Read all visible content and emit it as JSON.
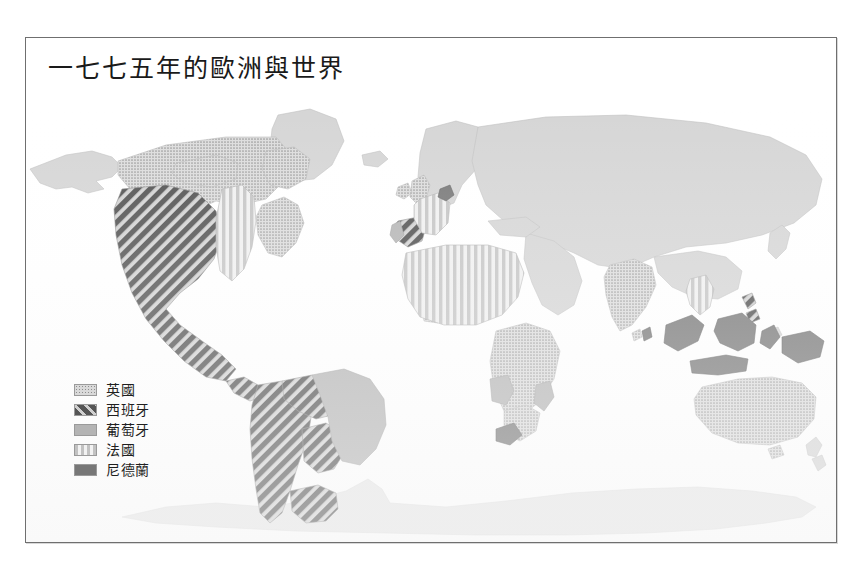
{
  "figure": {
    "title": "一七七五年的歐洲與世界",
    "frame_color": "#6f6f6f",
    "background_color": "#ffffff",
    "ocean_color": "#ffffff",
    "unclaimed_land_color": "#d5d5d5"
  },
  "legend": {
    "items": [
      {
        "label": "英國",
        "pattern": "dots",
        "swatch_class": "sw-dots",
        "color": "#d9d9d9"
      },
      {
        "label": "西班牙",
        "pattern": "diagonal",
        "swatch_class": "sw-diag",
        "color": "#555555"
      },
      {
        "label": "葡萄牙",
        "pattern": "solid-mid",
        "swatch_class": "sw-solidmid",
        "color": "#b4b4b4"
      },
      {
        "label": "法國",
        "pattern": "vertical",
        "swatch_class": "sw-vert",
        "color": "#c2c2c2"
      },
      {
        "label": "尼德蘭",
        "pattern": "solid-dark",
        "swatch_class": "sw-soliddark",
        "color": "#777777"
      }
    ]
  },
  "map_regions": {
    "britain": [
      "British Isles",
      "Canada",
      "Thirteen Colonies",
      "India",
      "Australia",
      "West Africa coast",
      "East Africa"
    ],
    "spain": [
      "Iberia",
      "Mexico",
      "Western North America",
      "Central America",
      "Spanish South America",
      "Philippines"
    ],
    "portugal": [
      "Portugal",
      "Brazil",
      "Angola",
      "Mozambique"
    ],
    "france": [
      "France",
      "North Africa",
      "Louisiana",
      "Indochina"
    ],
    "netherlands": [
      "Netherlands",
      "Dutch East Indies",
      "Ceylon",
      "Cape Colony"
    ],
    "neutral": [
      "Eurasia",
      "Antarctica",
      "Greenland",
      "Alaska",
      "China",
      "Russia"
    ]
  }
}
